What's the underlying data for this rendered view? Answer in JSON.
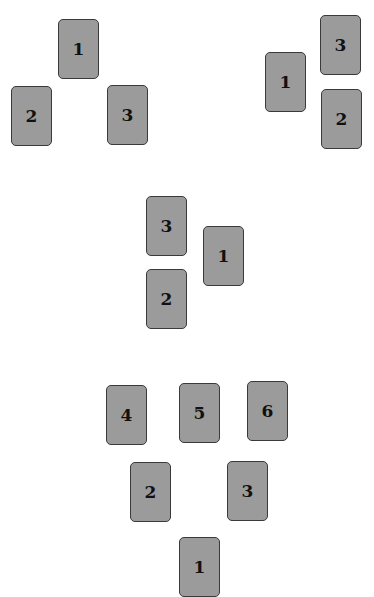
{
  "spreads": [
    {
      "name": "three-card-triangle",
      "cards": [
        {
          "label": "1",
          "x": 58,
          "y": 19
        },
        {
          "label": "2",
          "x": 11,
          "y": 86
        },
        {
          "label": "3",
          "x": 107,
          "y": 85
        }
      ]
    },
    {
      "name": "three-card-right-column",
      "cards": [
        {
          "label": "3",
          "x": 320,
          "y": 15
        },
        {
          "label": "1",
          "x": 265,
          "y": 52
        },
        {
          "label": "2",
          "x": 321,
          "y": 89
        }
      ]
    },
    {
      "name": "three-card-left-column",
      "cards": [
        {
          "label": "3",
          "x": 146,
          "y": 196
        },
        {
          "label": "1",
          "x": 203,
          "y": 226
        },
        {
          "label": "2",
          "x": 146,
          "y": 269
        }
      ]
    },
    {
      "name": "six-card-pyramid",
      "cards": [
        {
          "label": "4",
          "x": 106,
          "y": 385
        },
        {
          "label": "5",
          "x": 179,
          "y": 383
        },
        {
          "label": "6",
          "x": 247,
          "y": 381
        },
        {
          "label": "2",
          "x": 130,
          "y": 462
        },
        {
          "label": "3",
          "x": 227,
          "y": 461
        },
        {
          "label": "1",
          "x": 179,
          "y": 537
        }
      ]
    }
  ],
  "colors": {
    "card_fill": "#9b9b9b",
    "card_border": "#3a3a3a",
    "number_text": "#111111",
    "background": "#ffffff"
  }
}
